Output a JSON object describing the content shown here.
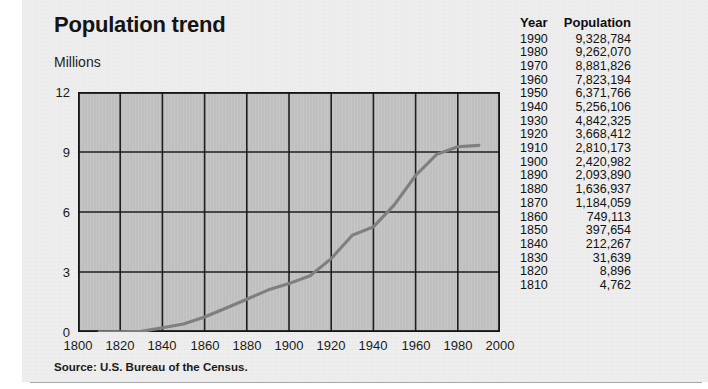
{
  "figure": {
    "title": "Population trend",
    "y_unit_label": "Millions",
    "source": "Source: U.S. Bureau of the Census."
  },
  "table": {
    "headers": {
      "year": "Year",
      "population": "Population"
    },
    "rows": [
      {
        "year": "1990",
        "population": "9,328,784"
      },
      {
        "year": "1980",
        "population": "9,262,070"
      },
      {
        "year": "1970",
        "population": "8,881,826"
      },
      {
        "year": "1960",
        "population": "7,823,194"
      },
      {
        "year": "1950",
        "population": "6,371,766"
      },
      {
        "year": "1940",
        "population": "5,256,106"
      },
      {
        "year": "1930",
        "population": "4,842,325"
      },
      {
        "year": "1920",
        "population": "3,668,412"
      },
      {
        "year": "1910",
        "population": "2,810,173"
      },
      {
        "year": "1900",
        "population": "2,420,982"
      },
      {
        "year": "1890",
        "population": "2,093,890"
      },
      {
        "year": "1880",
        "population": "1,636,937"
      },
      {
        "year": "1870",
        "population": "1,184,059"
      },
      {
        "year": "1860",
        "population": "749,113"
      },
      {
        "year": "1850",
        "population": "397,654"
      },
      {
        "year": "1840",
        "population": "212,267"
      },
      {
        "year": "1830",
        "population": "31,639"
      },
      {
        "year": "1820",
        "population": "8,896"
      },
      {
        "year": "1810",
        "population": "4,762"
      }
    ]
  },
  "chart_data": {
    "type": "line",
    "title": "Population trend",
    "xlabel": "",
    "ylabel": "Millions",
    "xlim": [
      1800,
      2000
    ],
    "ylim": [
      0,
      12
    ],
    "xticks": [
      1800,
      1820,
      1840,
      1860,
      1880,
      1900,
      1920,
      1940,
      1960,
      1980,
      2000
    ],
    "yticks": [
      0,
      3,
      6,
      9,
      12
    ],
    "xtick_labels": [
      "1800",
      "1820",
      "1840",
      "1860",
      "1880",
      "1900",
      "1920",
      "1940",
      "1960",
      "1980",
      "2000"
    ],
    "ytick_labels": [
      "0",
      "3",
      "6",
      "9",
      "12"
    ],
    "grid": true,
    "legend": "none",
    "plot_facecolor": "#c3c3c3",
    "line_color": "#7a7a7a",
    "x": [
      1810,
      1820,
      1830,
      1840,
      1850,
      1860,
      1870,
      1880,
      1890,
      1900,
      1910,
      1920,
      1930,
      1940,
      1950,
      1960,
      1970,
      1980,
      1990
    ],
    "values_millions": [
      0.005,
      0.009,
      0.032,
      0.212,
      0.398,
      0.749,
      1.184,
      1.637,
      2.094,
      2.421,
      2.81,
      3.668,
      4.842,
      5.256,
      6.372,
      7.823,
      8.882,
      9.262,
      9.329
    ],
    "series": [
      {
        "name": "Population",
        "values": [
          4762,
          8896,
          31639,
          212267,
          397654,
          749113,
          1184059,
          1636937,
          2093890,
          2420982,
          2810173,
          3668412,
          4842325,
          5256106,
          6371766,
          7823194,
          8881826,
          9262070,
          9328784
        ]
      }
    ]
  },
  "colors": {
    "paper": "#eeeeee",
    "plot_fill": "#c3c3c3",
    "grid": "#1e1e1e",
    "line": "#7a7a7a",
    "text": "#141414"
  }
}
